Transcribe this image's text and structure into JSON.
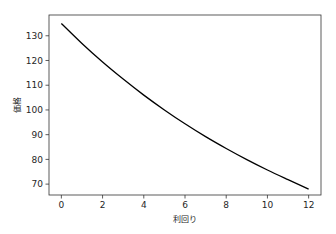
{
  "chart_data": {
    "type": "line",
    "title": "",
    "xlabel": "利回り",
    "ylabel": "価格",
    "xlim": [
      -0.6,
      12.6
    ],
    "ylim": [
      65.6,
      138.4
    ],
    "xticks": [
      0,
      2,
      4,
      6,
      8,
      10,
      12
    ],
    "yticks": [
      70,
      80,
      90,
      100,
      110,
      120,
      130
    ],
    "grid": false,
    "legend": null,
    "series": [
      {
        "name": "価格",
        "color": "#000000",
        "x": [
          0,
          1,
          2,
          3,
          4,
          5,
          6,
          7,
          8,
          9,
          10,
          11,
          12
        ],
        "y": [
          135.0,
          126.9,
          119.4,
          112.5,
          106.0,
          100.0,
          94.4,
          89.2,
          84.4,
          79.9,
          75.7,
          71.8,
          68.0
        ]
      }
    ]
  }
}
